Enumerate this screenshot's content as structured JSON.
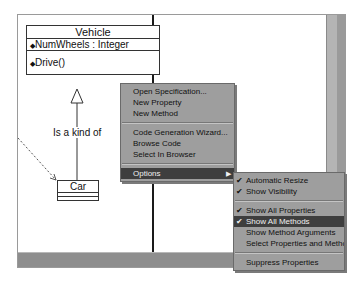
{
  "diagram": {
    "classes": [
      {
        "name": "Vehicle",
        "attributes": [
          "NumWheels : Integer"
        ],
        "operations": [
          "Drive()"
        ]
      },
      {
        "name": "Car",
        "attributes": [],
        "operations": []
      }
    ],
    "association_label": "Is a kind of"
  },
  "context_menu": {
    "items": [
      {
        "label": "Open Specification...",
        "accel": "O"
      },
      {
        "label": "New Property",
        "accel": "P"
      },
      {
        "label": "New Method",
        "accel": "M"
      },
      {
        "label": "Code Generation Wizard...",
        "accel": "G"
      },
      {
        "label": "Browse Code",
        "accel": "C"
      },
      {
        "label": "Select In Browser",
        "accel": "B"
      },
      {
        "label": "Options",
        "selected": true,
        "has_submenu": true
      }
    ]
  },
  "options_submenu": {
    "items": [
      {
        "label": "Automatic Resize",
        "checked": true
      },
      {
        "label": "Show Visibility",
        "checked": true
      },
      {
        "label": "Show All Properties",
        "checked": true
      },
      {
        "label": "Show All Methods",
        "checked": true,
        "selected": true
      },
      {
        "label": "Show Method Arguments",
        "checked": false
      },
      {
        "label": "Select Properties and Methods...",
        "checked": false
      },
      {
        "label": "Suppress Properties",
        "checked": false
      }
    ]
  },
  "icons": {
    "check": "✔",
    "submenu_arrow": "▶",
    "attribute": "◆",
    "operation": "◆"
  }
}
